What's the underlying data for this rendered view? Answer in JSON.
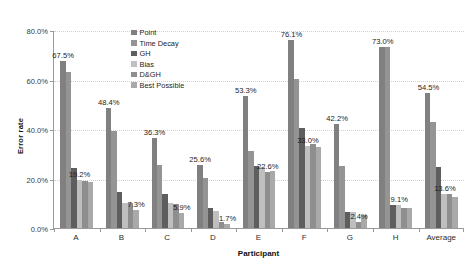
{
  "chart_data": {
    "type": "bar",
    "title": "",
    "subtitle": "",
    "xlabel": "Participant",
    "ylabel": "Error rate",
    "ylim": [
      0,
      80
    ],
    "ytick_labels": [
      "0.0%",
      "20.0%",
      "40.0%",
      "60.0%",
      "80.0%"
    ],
    "ytick_values": [
      0,
      20,
      40,
      60,
      80
    ],
    "grid": true,
    "legend_position": "inside-top-left",
    "categories": [
      "A",
      "B",
      "C",
      "D",
      "E",
      "F",
      "G",
      "H",
      "Average"
    ],
    "series": [
      {
        "name": "Point",
        "color": "#808080",
        "values": [
          67.5,
          48.4,
          36.3,
          25.6,
          53.3,
          76.1,
          42.2,
          73.0,
          54.5
        ]
      },
      {
        "name": "Time Decay",
        "color": "#949494",
        "values": [
          63.0,
          39.2,
          25.3,
          20.3,
          31.1,
          60.4,
          25.2,
          73.0,
          43.0
        ]
      },
      {
        "name": "GH",
        "color": "#5e5e5e",
        "values": [
          24.2,
          14.7,
          13.8,
          7.9,
          24.9,
          40.3,
          6.6,
          9.4,
          24.8
        ]
      },
      {
        "name": "Bias",
        "color": "#bfbfbf",
        "values": [
          19.2,
          10.2,
          10.0,
          6.7,
          24.7,
          33.0,
          6.6,
          9.1,
          13.6
        ]
      },
      {
        "name": "D&GH",
        "color": "#8e8e8e",
        "values": [
          18.8,
          10.1,
          9.8,
          2.4,
          22.6,
          34.1,
          2.4,
          8.2,
          13.9
        ]
      },
      {
        "name": "Best Possible",
        "color": "#a9a9a9",
        "values": [
          18.4,
          7.3,
          5.9,
          1.7,
          23.2,
          32.8,
          5.2,
          8.0,
          12.6
        ]
      }
    ],
    "value_labels": [
      {
        "text": "67.5%",
        "group": 0,
        "series": 0,
        "value": 67.5
      },
      {
        "text": "19.2%",
        "group": 0,
        "series": 3,
        "value": 19.2
      },
      {
        "text": "48.4%",
        "group": 1,
        "series": 0,
        "value": 48.4
      },
      {
        "text": "7.3%",
        "group": 1,
        "series": 5,
        "value": 7.3
      },
      {
        "text": "36.3%",
        "group": 2,
        "series": 0,
        "value": 36.3
      },
      {
        "text": "5.9%",
        "group": 2,
        "series": 5,
        "value": 5.9
      },
      {
        "text": "25.6%",
        "group": 3,
        "series": 0,
        "value": 25.6
      },
      {
        "text": "1.7%",
        "group": 3,
        "series": 5,
        "value": 1.7
      },
      {
        "text": "53.3%",
        "group": 4,
        "series": 0,
        "value": 53.3
      },
      {
        "text": "22.6%",
        "group": 4,
        "series": 4,
        "value": 22.6
      },
      {
        "text": "76.1%",
        "group": 5,
        "series": 0,
        "value": 76.1
      },
      {
        "text": "33.0%",
        "group": 5,
        "series": 3,
        "value": 33.0
      },
      {
        "text": "42.2%",
        "group": 6,
        "series": 0,
        "value": 42.2
      },
      {
        "text": "2.4%",
        "group": 6,
        "series": 4,
        "value": 2.4
      },
      {
        "text": "73.0%",
        "group": 7,
        "series": 0,
        "value": 73.0
      },
      {
        "text": "9.1%",
        "group": 7,
        "series": 3,
        "value": 9.1
      },
      {
        "text": "54.5%",
        "group": 8,
        "series": 0,
        "value": 54.5
      },
      {
        "text": "13.6%",
        "group": 8,
        "series": 3,
        "value": 13.6
      }
    ]
  },
  "axes": {
    "y_title": "Error rate",
    "x_title": "Participant"
  }
}
